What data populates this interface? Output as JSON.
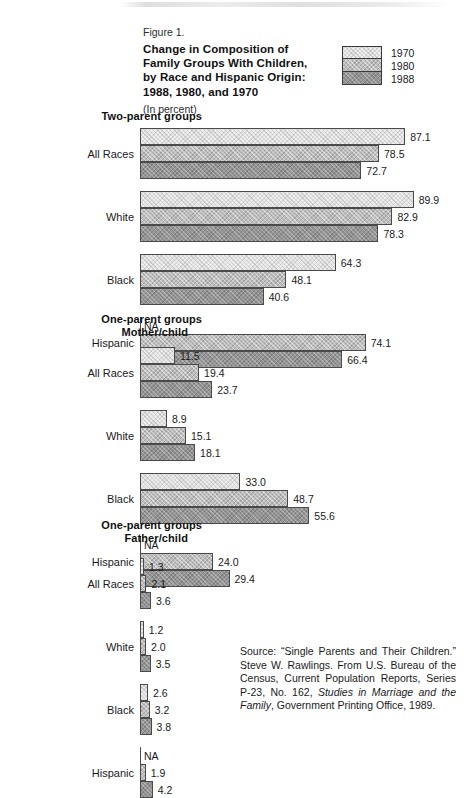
{
  "figure": {
    "number": "Figure 1.",
    "title_lines": [
      "Change in Composition of",
      "Family Groups With Children,",
      "by Race and Hispanic Origin:",
      "1988, 1980, and 1970"
    ],
    "units": "(In percent)"
  },
  "legend": {
    "items": [
      {
        "label": "1970",
        "color": "#eeeeee"
      },
      {
        "label": "1980",
        "color": "#bdbdbd"
      },
      {
        "label": "1988",
        "color": "#949494"
      }
    ]
  },
  "sections": [
    {
      "heading_lines": [
        "Two-parent groups"
      ]
    },
    {
      "heading_lines": [
        "One-parent groups",
        "Mother/child"
      ]
    },
    {
      "heading_lines": [
        "One-parent groups",
        "Father/child"
      ]
    }
  ],
  "source": {
    "prefix": "Source: “Single Parents and Their Children.” Steve W. Rawlings. From U.S. Bureau of the Census, Current Population Reports, Series P-23, No. 162, ",
    "italic": "Studies in Marriage and the Family",
    "suffix": ", Government Printing Office, 1989."
  },
  "na_text": "NA",
  "chart_data": {
    "type": "bar",
    "orientation": "horizontal",
    "title": "Change in Composition of Family Groups With Children, by Race and Hispanic Origin: 1988, 1980, and 1970",
    "subtitle": "Figure 1.",
    "units": "(In percent)",
    "xlabel": "",
    "ylabel": "",
    "xlim": [
      0,
      100
    ],
    "grid": false,
    "legend_position": "top-right",
    "series_order": [
      "1970",
      "1980",
      "1988"
    ],
    "series_colors": {
      "1970": "#eeeeee",
      "1980": "#bdbdbd",
      "1988": "#949494"
    },
    "groups": [
      {
        "section": "Two-parent groups",
        "categories": [
          "All Races",
          "White",
          "Black",
          "Hispanic"
        ],
        "series": [
          {
            "name": "1970",
            "values": [
              87.1,
              89.9,
              64.3,
              null
            ],
            "labels": [
              "87.1",
              "89.9",
              "64.3",
              "NA"
            ]
          },
          {
            "name": "1980",
            "values": [
              78.5,
              82.9,
              48.1,
              74.1
            ],
            "labels": [
              "78.5",
              "82.9",
              "48.1",
              "74.1"
            ]
          },
          {
            "name": "1988",
            "values": [
              72.7,
              78.3,
              40.6,
              66.4
            ],
            "labels": [
              "72.7",
              "78.3",
              "40.6",
              "66.4"
            ]
          }
        ]
      },
      {
        "section": "One-parent groups Mother/child",
        "categories": [
          "All Races",
          "White",
          "Black",
          "Hispanic"
        ],
        "series": [
          {
            "name": "1970",
            "values": [
              11.5,
              8.9,
              33.0,
              null
            ],
            "labels": [
              "11.5",
              "8.9",
              "33.0",
              "NA"
            ]
          },
          {
            "name": "1980",
            "values": [
              19.4,
              15.1,
              48.7,
              24.0
            ],
            "labels": [
              "19.4",
              "15.1",
              "48.7",
              "24.0"
            ]
          },
          {
            "name": "1988",
            "values": [
              23.7,
              18.1,
              55.6,
              29.4
            ],
            "labels": [
              "23.7",
              "18.1",
              "55.6",
              "29.4"
            ]
          }
        ]
      },
      {
        "section": "One-parent groups Father/child",
        "categories": [
          "All Races",
          "White",
          "Black",
          "Hispanic"
        ],
        "series": [
          {
            "name": "1970",
            "values": [
              1.3,
              1.2,
              2.6,
              null
            ],
            "labels": [
              "1.3",
              "1.2",
              "2.6",
              "NA"
            ]
          },
          {
            "name": "1980",
            "values": [
              2.1,
              2.0,
              3.2,
              1.9
            ],
            "labels": [
              "2.1",
              "2.0",
              "3.2",
              "1.9"
            ]
          },
          {
            "name": "1988",
            "values": [
              3.6,
              3.5,
              3.8,
              4.2
            ],
            "labels": [
              "3.6",
              "3.5",
              "3.8",
              "4.2"
            ]
          }
        ]
      }
    ]
  },
  "layout": {
    "bar_origin_x": 140,
    "px_per_unit": 3.045,
    "bar_height": 17,
    "group_gap": 12,
    "section_tops": [
      128,
      347,
      558
    ],
    "section_head_tops": [
      110,
      313,
      519
    ]
  }
}
